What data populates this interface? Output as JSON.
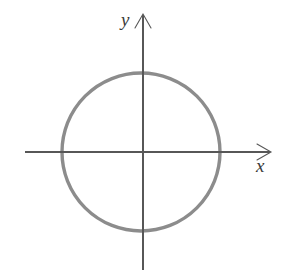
{
  "figure": {
    "kind": "coordinate-plane-with-circle",
    "background_color": "#ffffff",
    "width": 289,
    "height": 275,
    "axes": {
      "x_axis_label": "x",
      "y_axis_label": "y",
      "axis_color": "#575757",
      "axis_stroke_width": 1.1,
      "arrowhead_style": "open-v",
      "origin": {
        "x": 143,
        "y": 152
      },
      "x_axis_line": {
        "x1": 25,
        "y1": 152,
        "x2": 270,
        "y2": 152
      },
      "y_axis_line": {
        "x1": 143,
        "y1": 15,
        "x2": 143,
        "y2": 270
      },
      "x_arrow_tip": {
        "x": 270,
        "y": 152
      },
      "y_arrow_tip": {
        "x": 143,
        "y": 15
      },
      "tick_labels_x": [],
      "tick_labels_y": [],
      "grid": false
    },
    "curve": {
      "shape": "circle",
      "center": {
        "x": 141,
        "y": 152
      },
      "radius": 79,
      "stroke_color": "#8c8c8c",
      "stroke_width": 3.4,
      "fill": "none"
    },
    "annotations": []
  },
  "chart_data": {
    "type": "scatter",
    "title": "",
    "xlabel": "x",
    "ylabel": "y",
    "grid": false,
    "legend": null,
    "xlim": [
      -1.5,
      1.6
    ],
    "ylim": [
      -1.5,
      1.5
    ],
    "series": [
      {
        "name": "circle x^2 + y^2 = r^2",
        "shape": "circle",
        "center_data": [
          0,
          0
        ],
        "radius_data": 1,
        "closed": true,
        "color": "#8c8c8c"
      }
    ],
    "tick_labels": {
      "x": [],
      "y": []
    },
    "annotations": [
      {
        "text": "y",
        "position": "y-axis-tip"
      },
      {
        "text": "x",
        "position": "x-axis-tip"
      }
    ]
  }
}
